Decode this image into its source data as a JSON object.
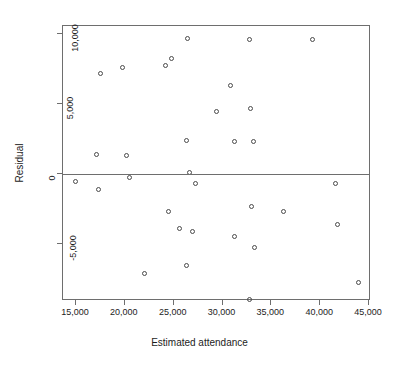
{
  "chart_data": {
    "type": "scatter",
    "title": "",
    "xlabel": "Estimated attendance",
    "ylabel": "Residual",
    "xlim": [
      14000,
      45600
    ],
    "ylim": [
      -9800,
      10600
    ],
    "xticks": [
      15000,
      20000,
      25000,
      30000,
      35000,
      40000,
      45000
    ],
    "xtick_labels": [
      "15,000",
      "20,000",
      "25,000",
      "30,000",
      "35,000",
      "40,000",
      "45,000"
    ],
    "yticks": [
      10000,
      5000,
      0,
      -5000
    ],
    "ytick_labels": [
      "10,000",
      "5,000",
      "0",
      "-5,000"
    ],
    "grid": false,
    "legend": null,
    "reference_lines": [
      {
        "orientation": "horizontal",
        "y": 0
      }
    ],
    "marker": "open-circle",
    "points": [
      {
        "x": 14930,
        "y": -540
      },
      {
        "x": 17090,
        "y": 1390
      },
      {
        "x": 17320,
        "y": -1140
      },
      {
        "x": 17540,
        "y": 7150
      },
      {
        "x": 19810,
        "y": 7540
      },
      {
        "x": 20120,
        "y": 1320
      },
      {
        "x": 20440,
        "y": -250
      },
      {
        "x": 22000,
        "y": -7140
      },
      {
        "x": 24170,
        "y": 7750
      },
      {
        "x": 24440,
        "y": -2680
      },
      {
        "x": 24820,
        "y": 8200
      },
      {
        "x": 25620,
        "y": -3930
      },
      {
        "x": 26360,
        "y": -6540
      },
      {
        "x": 26360,
        "y": 2380
      },
      {
        "x": 26370,
        "y": 9610
      },
      {
        "x": 26600,
        "y": 36
      },
      {
        "x": 26930,
        "y": -4110
      },
      {
        "x": 27270,
        "y": -730
      },
      {
        "x": 29370,
        "y": 4440
      },
      {
        "x": 30820,
        "y": 6290
      },
      {
        "x": 31210,
        "y": -4500
      },
      {
        "x": 31220,
        "y": 2300
      },
      {
        "x": 32730,
        "y": -9010
      },
      {
        "x": 32730,
        "y": 9600
      },
      {
        "x": 32840,
        "y": 4630
      },
      {
        "x": 32920,
        "y": -2330
      },
      {
        "x": 33220,
        "y": 2310
      },
      {
        "x": 33240,
        "y": -5320
      },
      {
        "x": 36270,
        "y": -2680
      },
      {
        "x": 39220,
        "y": 9600
      },
      {
        "x": 41520,
        "y": -700
      },
      {
        "x": 41800,
        "y": -3630
      },
      {
        "x": 43970,
        "y": -7770
      }
    ]
  }
}
